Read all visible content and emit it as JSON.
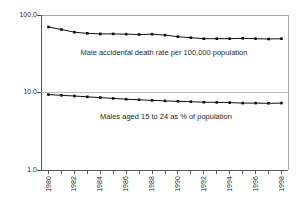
{
  "figure": {
    "background": "#ffffff"
  },
  "chart_data": {
    "type": "line",
    "y_scale": "log10",
    "ylim": [
      1,
      100
    ],
    "y_ticks": [
      "100.0",
      "10.0",
      "1.0"
    ],
    "y_tick_values": [
      100,
      10,
      1
    ],
    "x": [
      1980,
      1981,
      1982,
      1983,
      1984,
      1985,
      1986,
      1987,
      1988,
      1989,
      1990,
      1991,
      1992,
      1993,
      1994,
      1995,
      1996,
      1997,
      1998
    ],
    "x_tick_labels": [
      "1980",
      "1982",
      "1984",
      "1986",
      "1988",
      "1990",
      "1992",
      "1994",
      "1996",
      "1998"
    ],
    "x_label_every": 2,
    "grid": "horizontal-major",
    "legend_position": "none-inline-annotations",
    "title": "",
    "xlabel": "",
    "ylabel": "",
    "series": [
      {
        "name": "Male accidental death rate per 100,000 population",
        "marker": "square",
        "values": [
          70,
          65,
          60,
          58,
          57,
          57,
          56.5,
          56,
          56.5,
          55,
          52.5,
          51,
          49.5,
          49.5,
          49.5,
          50,
          49.5,
          49,
          49.5
        ]
      },
      {
        "name": "Males aged 15 to 24 as % of population",
        "marker": "square",
        "values": [
          9.4,
          9.2,
          9.0,
          8.8,
          8.6,
          8.4,
          8.2,
          8.05,
          7.9,
          7.8,
          7.7,
          7.6,
          7.5,
          7.45,
          7.4,
          7.3,
          7.3,
          7.25,
          7.3
        ]
      }
    ],
    "colors": {
      "line": "#111111",
      "axis": "#555555",
      "frame": "#a8a8a8",
      "grid": "#bdbdbd",
      "text": "#2a2a2a",
      "background": "#ffffff"
    }
  }
}
